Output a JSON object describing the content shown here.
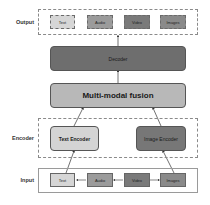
{
  "diagram": {
    "rows": {
      "output": {
        "label": "Output"
      },
      "encoder": {
        "label": "Encoder"
      },
      "input": {
        "label": "Input"
      }
    },
    "output_items": [
      {
        "label": "Text",
        "color": "#d6d6d6"
      },
      {
        "label": "Audio",
        "color": "#9b9b9b"
      },
      {
        "label": "Video",
        "color": "#7a7a7a"
      },
      {
        "label": "Images",
        "color": "#8a8a8a"
      }
    ],
    "decoder": {
      "label": "Decoder",
      "color": "#6e6e6e"
    },
    "fusion": {
      "label": "Multi-modal fusion",
      "color": "#b8b8b8"
    },
    "encoders": [
      {
        "label": "Text Encoder",
        "color": "#d4d4d4"
      },
      {
        "label": "Image Encoder",
        "color": "#777777"
      }
    ],
    "input_items": [
      {
        "label": "Text",
        "color": "#d6d6d6"
      },
      {
        "label": "Audio",
        "color": "#9b9b9b"
      },
      {
        "label": "Video",
        "color": "#7a7a7a"
      },
      {
        "label": "Images",
        "color": "#8a8a8a"
      }
    ]
  }
}
